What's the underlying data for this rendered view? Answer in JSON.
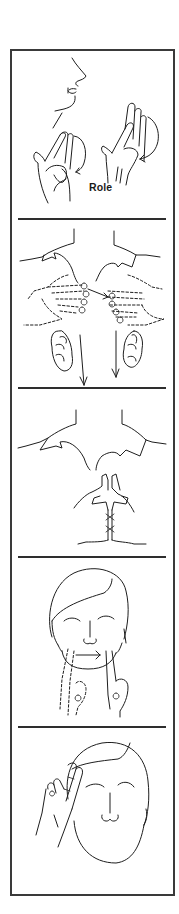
{
  "figure": {
    "type": "sign-language illustration strip",
    "panel_count": 5,
    "border_color": "#3a3a3a",
    "line_color": "#1e1e1e",
    "background": "#ffffff"
  },
  "panels": [
    {
      "index": 1,
      "label": "Role",
      "depicts": "profile of lower face with two hands forming R-handshapes rotating in circles in front of body",
      "icons": [
        "face-profile-icon",
        "hand-r-shape-icon",
        "circular-arrow-icon"
      ]
    },
    {
      "index": 2,
      "label": "",
      "depicts": "shoulders/collar with both flat hands moving toward each other (dashed motion) then moving down, with downward arrows",
      "icons": [
        "collar-icon",
        "hands-icon",
        "down-arrow-icon"
      ]
    },
    {
      "index": 3,
      "label": "",
      "depicts": "shoulders/collar with both hands pinched together at center and moving down the chest",
      "icons": [
        "collar-icon",
        "pinched-hands-icon"
      ]
    },
    {
      "index": 4,
      "label": "",
      "depicts": "front face with index finger moving across chin from left to right (dashed previous position, arrow)",
      "icons": [
        "face-front-icon",
        "index-finger-icon",
        "right-arrow-icon"
      ]
    },
    {
      "index": 5,
      "label": "",
      "depicts": "front face with two fingers (V-shape) touching the temple",
      "icons": [
        "face-front-icon",
        "two-finger-hand-icon"
      ]
    }
  ]
}
